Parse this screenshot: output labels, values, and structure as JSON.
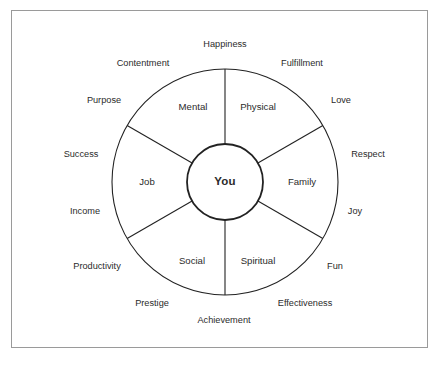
{
  "diagram": {
    "title": "You",
    "center": {
      "label": "You"
    },
    "sectors": [
      {
        "name": "mental",
        "label": "Mental",
        "x": 193,
        "y": 107
      },
      {
        "name": "physical",
        "label": "Physical",
        "x": 258,
        "y": 107
      },
      {
        "name": "family",
        "label": "Family",
        "x": 302,
        "y": 182
      },
      {
        "name": "spiritual",
        "label": "Spiritual",
        "x": 258,
        "y": 261
      },
      {
        "name": "social",
        "label": "Social",
        "x": 192,
        "y": 261
      },
      {
        "name": "job",
        "label": "Job",
        "x": 147,
        "y": 182
      }
    ],
    "outer_labels": [
      {
        "name": "happiness",
        "label": "Happiness",
        "x": 225,
        "y": 45
      },
      {
        "name": "fulfillment",
        "label": "Fulfillment",
        "x": 302,
        "y": 64
      },
      {
        "name": "love",
        "label": "Love",
        "x": 341,
        "y": 101
      },
      {
        "name": "respect",
        "label": "Respect",
        "x": 368,
        "y": 155
      },
      {
        "name": "joy",
        "label": "Joy",
        "x": 355,
        "y": 212
      },
      {
        "name": "fun",
        "label": "Fun",
        "x": 335,
        "y": 267
      },
      {
        "name": "effectiveness",
        "label": "Effectiveness",
        "x": 305,
        "y": 304
      },
      {
        "name": "achievement",
        "label": "Achievement",
        "x": 224,
        "y": 321
      },
      {
        "name": "prestige",
        "label": "Prestige",
        "x": 152,
        "y": 304
      },
      {
        "name": "productivity",
        "label": "Productivity",
        "x": 97,
        "y": 267
      },
      {
        "name": "income",
        "label": "Income",
        "x": 85,
        "y": 212
      },
      {
        "name": "success",
        "label": "Success",
        "x": 81,
        "y": 155
      },
      {
        "name": "purpose",
        "label": "Purpose",
        "x": 104,
        "y": 101
      },
      {
        "name": "contentment",
        "label": "Contentment",
        "x": 143,
        "y": 64
      }
    ],
    "geometry": {
      "center_x": 225,
      "center_y": 182,
      "outer_radius": 113,
      "inner_radius": 38,
      "spoke_angles_deg": [
        90,
        150,
        210,
        270,
        330,
        30
      ]
    },
    "colors": {
      "stroke": "#222222",
      "text": "#2b2b2b",
      "frame": "#9a9a9a",
      "background": "#ffffff"
    }
  }
}
